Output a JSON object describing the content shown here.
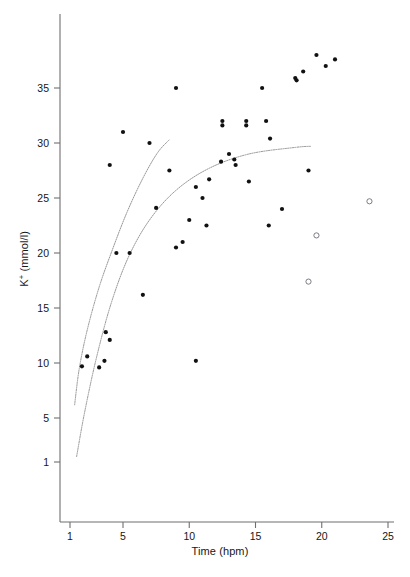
{
  "chart_data": {
    "type": "scatter",
    "title": "",
    "xlabel": "Time (hpm)",
    "ylabel": "K+ (mmol/l)",
    "ylabel_display": "K⁺ (mmol/l)",
    "xlim": [
      1,
      25
    ],
    "ylim": [
      1,
      38
    ],
    "xticks": [
      1,
      5,
      10,
      15,
      20,
      25
    ],
    "yticks": [
      1,
      5,
      10,
      15,
      20,
      25,
      30,
      35
    ],
    "grid": false,
    "legend": "none",
    "series": [
      {
        "name": "Measured samples",
        "marker": "filled-circle",
        "color": "#111111",
        "points": [
          [
            1.9,
            9.7
          ],
          [
            2.3,
            10.6
          ],
          [
            3.2,
            9.6
          ],
          [
            3.6,
            10.2
          ],
          [
            3.7,
            12.8
          ],
          [
            4.0,
            12.1
          ],
          [
            4.0,
            28.0
          ],
          [
            4.5,
            20.0
          ],
          [
            5.5,
            20.0
          ],
          [
            5.0,
            31.0
          ],
          [
            6.5,
            16.2
          ],
          [
            7.0,
            30.0
          ],
          [
            7.5,
            24.1
          ],
          [
            8.5,
            27.5
          ],
          [
            9.0,
            20.5
          ],
          [
            9.0,
            35.0
          ],
          [
            9.5,
            21.0
          ],
          [
            10.0,
            23.0
          ],
          [
            10.5,
            26.0
          ],
          [
            10.5,
            10.2
          ],
          [
            11.0,
            25.0
          ],
          [
            11.3,
            22.5
          ],
          [
            11.5,
            26.7
          ],
          [
            12.4,
            28.3
          ],
          [
            12.5,
            32.0
          ],
          [
            12.5,
            31.6
          ],
          [
            13.0,
            29.0
          ],
          [
            13.4,
            28.5
          ],
          [
            13.5,
            28.0
          ],
          [
            14.3,
            32.0
          ],
          [
            14.3,
            31.6
          ],
          [
            14.5,
            26.5
          ],
          [
            15.5,
            35.0
          ],
          [
            15.8,
            32.0
          ],
          [
            16.0,
            22.5
          ],
          [
            16.1,
            30.4
          ],
          [
            17.0,
            24.0
          ],
          [
            18.0,
            35.9
          ],
          [
            18.1,
            35.7
          ],
          [
            18.6,
            36.5
          ],
          [
            19.0,
            27.5
          ],
          [
            19.6,
            38.0
          ],
          [
            20.3,
            37.0
          ],
          [
            21.0,
            37.6
          ]
        ]
      },
      {
        "name": "Outlier / censored samples",
        "marker": "open-circle",
        "color": "#6d6d78",
        "points": [
          [
            19.0,
            17.4
          ],
          [
            19.6,
            21.6
          ],
          [
            23.6,
            24.7
          ]
        ]
      }
    ],
    "curves": [
      {
        "name": "upper confidence curve",
        "style": "dotted",
        "color": "#8a8a8a",
        "points": [
          [
            1.35,
            6.2
          ],
          [
            1.7,
            9.5
          ],
          [
            2.3,
            13.0
          ],
          [
            3.2,
            16.9
          ],
          [
            4.2,
            20.3
          ],
          [
            5.3,
            23.7
          ],
          [
            6.5,
            26.8
          ],
          [
            7.6,
            29.1
          ],
          [
            8.5,
            30.3
          ]
        ]
      },
      {
        "name": "lower fitted curve",
        "style": "dotted",
        "color": "#8a8a8a",
        "points": [
          [
            1.5,
            1.5
          ],
          [
            2.1,
            5.5
          ],
          [
            3.0,
            10.5
          ],
          [
            4.1,
            15.4
          ],
          [
            5.4,
            19.6
          ],
          [
            7.0,
            23.0
          ],
          [
            9.0,
            25.7
          ],
          [
            11.5,
            27.7
          ],
          [
            14.5,
            29.0
          ],
          [
            18.0,
            29.6
          ],
          [
            19.2,
            29.7
          ]
        ]
      }
    ]
  },
  "figure": {
    "x_axis_name": "time-axis",
    "y_axis_name": "potassium-axis",
    "background": "#ffffff",
    "axis_color": "#6f6f6f",
    "point_color": "#111111",
    "open_point_color": "#6d6d78",
    "curve_color": "#8a8a8a"
  }
}
